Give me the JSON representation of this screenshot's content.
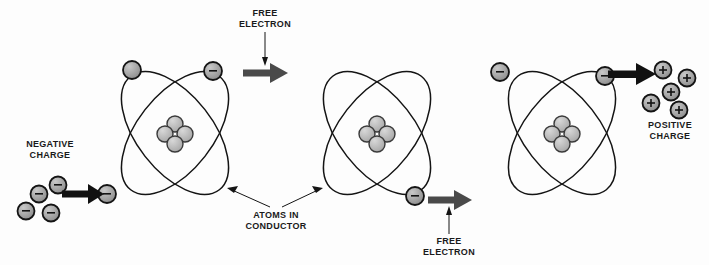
{
  "diagram": {
    "background_color": "#fdfdfd",
    "ink_color": "#141414",
    "gray_arrow_color": "#4a4a4a",
    "black_arrow_color": "#111111",
    "particle_fill": "#9a9a9a",
    "nucleus_fill": "#b5b5b5",
    "labels": {
      "negative_charge": "NEGATIVE\nCHARGE",
      "free_electron_top": "FREE\nELECTRON",
      "free_electron_bottom": "FREE\nELECTRON",
      "atoms_in_conductor": "ATOMS IN\nCONDUCTOR",
      "positive_charge": "POSITIVE\nCHARGE"
    },
    "atoms": [
      {
        "name": "atom-left",
        "cx": 175,
        "cy": 133,
        "electrons": [
          {
            "x": 132,
            "y": 70,
            "sign": ""
          },
          {
            "x": 213,
            "y": 71,
            "sign": "-"
          },
          {
            "x": 107,
            "y": 194,
            "sign": "-"
          }
        ],
        "nucleus_particles": 4
      },
      {
        "name": "atom-middle",
        "cx": 377,
        "cy": 133,
        "electrons": [
          {
            "x": 415,
            "y": 196,
            "sign": "-"
          }
        ],
        "nucleus_particles": 4
      },
      {
        "name": "atom-right",
        "cx": 562,
        "cy": 133,
        "electrons": [
          {
            "x": 500,
            "y": 72,
            "sign": "-"
          },
          {
            "x": 605,
            "y": 76,
            "sign": "-"
          }
        ],
        "nucleus_particles": 4
      }
    ],
    "negative_charge_cluster": {
      "particles": [
        {
          "x": 58,
          "y": 185,
          "sign": "-"
        },
        {
          "x": 39,
          "y": 194,
          "sign": "-"
        },
        {
          "x": 26,
          "y": 211,
          "sign": "-"
        },
        {
          "x": 51,
          "y": 213,
          "sign": "-"
        }
      ]
    },
    "positive_charge_cluster": {
      "particles": [
        {
          "x": 663,
          "y": 70,
          "sign": "+"
        },
        {
          "x": 687,
          "y": 78,
          "sign": "+"
        },
        {
          "x": 671,
          "y": 92,
          "sign": "+"
        },
        {
          "x": 651,
          "y": 103,
          "sign": "+"
        },
        {
          "x": 679,
          "y": 110,
          "sign": "+"
        }
      ]
    },
    "arrows": [
      {
        "name": "arrow-negative-input",
        "x1": 62,
        "y1": 194,
        "x2": 103,
        "y2": 194,
        "style": "black"
      },
      {
        "name": "arrow-free-electron-top",
        "x1": 243,
        "y1": 73,
        "x2": 288,
        "y2": 73,
        "style": "gray"
      },
      {
        "name": "arrow-free-electron-bottom",
        "x1": 428,
        "y1": 200,
        "x2": 472,
        "y2": 200,
        "style": "gray"
      },
      {
        "name": "arrow-positive-output",
        "x1": 608,
        "y1": 74,
        "x2": 655,
        "y2": 74,
        "style": "black"
      }
    ]
  }
}
